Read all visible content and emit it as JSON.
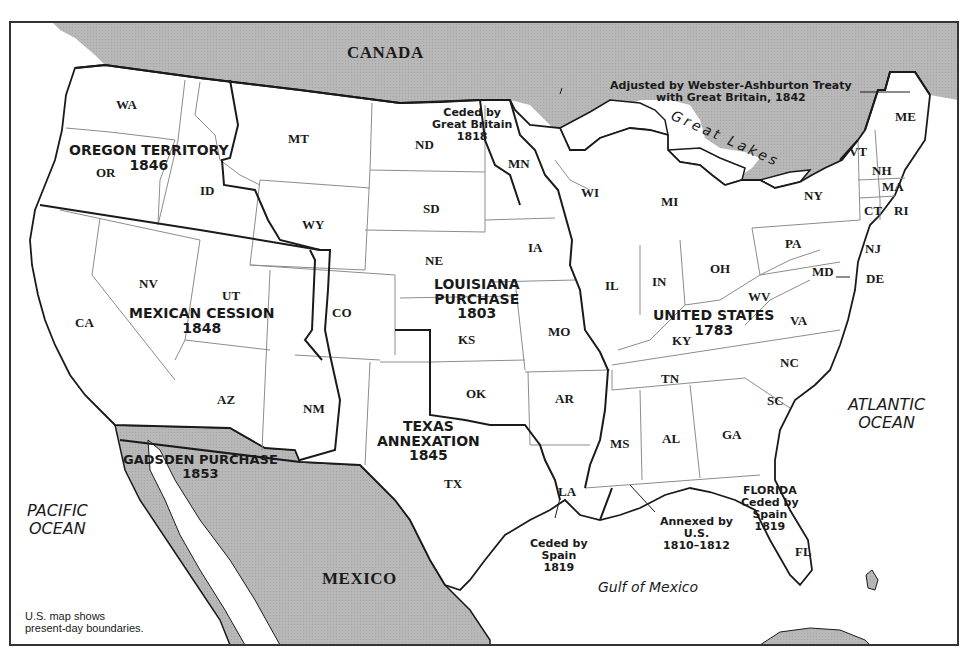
{
  "map": {
    "colors": {
      "land_foreign": "#b5b5b5",
      "land_us": "#ffffff",
      "water": "#ffffff",
      "state_border": "#8c8c8c",
      "acquisition_border": "#1a1a1a",
      "frame": "#333333"
    },
    "countries": {
      "canada": "CANADA",
      "mexico": "MEXICO"
    },
    "water_bodies": {
      "pacific": [
        "PACIFIC",
        "OCEAN"
      ],
      "atlantic": [
        "ATLANTIC",
        "OCEAN"
      ],
      "gulf": "Gulf of Mexico",
      "great_lakes": "Great Lakes"
    },
    "acquisitions": [
      {
        "id": "oregon",
        "name": "OREGON TERRITORY",
        "year": "1846"
      },
      {
        "id": "mexican_cession",
        "name": "MEXICAN CESSION",
        "year": "1848"
      },
      {
        "id": "louisiana",
        "name_line1": "LOUISIANA",
        "name_line2": "PURCHASE",
        "year": "1803"
      },
      {
        "id": "united_states",
        "name": "UNITED STATES",
        "year": "1783"
      },
      {
        "id": "texas",
        "name_line1": "TEXAS",
        "name_line2": "ANNEXATION",
        "year": "1845"
      },
      {
        "id": "gadsden",
        "name": "GADSDEN PURCHASE",
        "year": "1853"
      },
      {
        "id": "florida",
        "name": "FLORIDA",
        "line2": "Ceded by",
        "line3": "Spain",
        "year": "1819"
      }
    ],
    "annotations": {
      "ceded_gb": [
        "Ceded by",
        "Great Britain",
        "1818"
      ],
      "webster_ashburton": [
        "Adjusted by Webster-Ashburton Treaty",
        "with Great Britain, 1842"
      ],
      "ceded_spain_la": [
        "Ceded by",
        "Spain",
        "1819"
      ],
      "annexed_us": [
        "Annexed by",
        "U.S.",
        "1810–1812"
      ]
    },
    "states": {
      "WA": "WA",
      "OR": "OR",
      "ID": "ID",
      "MT": "MT",
      "WY": "WY",
      "ND": "ND",
      "SD": "SD",
      "NE": "NE",
      "MN": "MN",
      "IA": "IA",
      "WI": "WI",
      "MI": "MI",
      "IL": "IL",
      "IN": "IN",
      "OH": "OH",
      "NY": "NY",
      "PA": "PA",
      "VT": "VT",
      "NH": "NH",
      "ME": "ME",
      "MA": "MA",
      "CT": "CT",
      "RI": "RI",
      "NJ": "NJ",
      "DE": "DE",
      "MD": "MD",
      "WV": "WV",
      "VA": "VA",
      "KY": "KY",
      "NC": "NC",
      "TN": "TN",
      "SC": "SC",
      "GA": "GA",
      "AL": "AL",
      "MS": "MS",
      "FL": "FL",
      "LA": "LA",
      "AR": "AR",
      "MO": "MO",
      "KS": "KS",
      "OK": "OK",
      "TX": "TX",
      "CO": "CO",
      "NM": "NM",
      "AZ": "AZ",
      "UT": "UT",
      "NV": "NV",
      "CA": "CA"
    },
    "footnote": [
      "U.S. map shows",
      "present-day boundaries."
    ]
  }
}
